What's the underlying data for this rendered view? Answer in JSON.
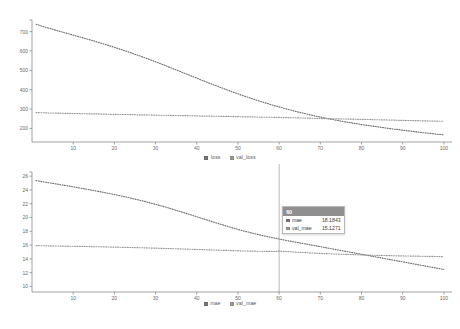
{
  "panels": {
    "loss": {
      "legend": [
        {
          "label": "loss",
          "swatch": "#7a7a7a"
        },
        {
          "label": "val_loss",
          "swatch": "#9a9a9a"
        }
      ]
    },
    "mae": {
      "legend": [
        {
          "label": "mae",
          "swatch": "#7a7a7a"
        },
        {
          "label": "val_mae",
          "swatch": "#9a9a9a"
        }
      ]
    }
  },
  "tooltip": {
    "header": "60",
    "rows": [
      {
        "name": "mae",
        "value": "18.1843",
        "swatch": "#7a7a7a"
      },
      {
        "name": "val_mae",
        "value": "15.1271",
        "swatch": "#9a9a9a"
      }
    ]
  },
  "colors": {
    "axis": "#8c8c8c",
    "series_primary": "#6f6f6f",
    "series_secondary": "#9a9a9a",
    "crosshair": "#9a9a9a",
    "tick_text": "#6a6a6a",
    "background": "#ffffff"
  },
  "chart_data": [
    {
      "type": "line",
      "id": "loss-chart",
      "title": "",
      "xlabel": "",
      "ylabel": "",
      "xlim": [
        0,
        101
      ],
      "ylim": [
        130,
        760
      ],
      "grid": false,
      "legend_position": "bottom-center",
      "xticks": [
        10,
        20,
        30,
        40,
        50,
        60,
        70,
        80,
        90,
        100
      ],
      "yticks": [
        200,
        300,
        400,
        500,
        600,
        700
      ],
      "x": [
        1,
        2,
        3,
        4,
        5,
        6,
        7,
        8,
        9,
        10,
        11,
        12,
        13,
        14,
        15,
        16,
        17,
        18,
        19,
        20,
        21,
        22,
        23,
        24,
        25,
        26,
        27,
        28,
        29,
        30,
        31,
        32,
        33,
        34,
        35,
        36,
        37,
        38,
        39,
        40,
        41,
        42,
        43,
        44,
        45,
        46,
        47,
        48,
        49,
        50,
        51,
        52,
        53,
        54,
        55,
        56,
        57,
        58,
        59,
        60,
        61,
        62,
        63,
        64,
        65,
        66,
        67,
        68,
        69,
        70,
        71,
        72,
        73,
        74,
        75,
        76,
        77,
        78,
        79,
        80,
        81,
        82,
        83,
        84,
        85,
        86,
        87,
        88,
        89,
        90,
        91,
        92,
        93,
        94,
        95,
        96,
        97,
        98,
        99,
        100
      ],
      "series": [
        {
          "name": "loss",
          "values": [
            738,
            731,
            724,
            718,
            712,
            706,
            700,
            694,
            688,
            682,
            676,
            670,
            664,
            658,
            652,
            645,
            639,
            632,
            626,
            619,
            612,
            605,
            598,
            591,
            583,
            576,
            568,
            560,
            552,
            544,
            536,
            528,
            519,
            511,
            502,
            494,
            485,
            477,
            468,
            460,
            451,
            443,
            434,
            426,
            418,
            410,
            402,
            394,
            386,
            379,
            371,
            364,
            357,
            350,
            343,
            336,
            330,
            323,
            317,
            311,
            305,
            299,
            294,
            288,
            283,
            278,
            273,
            268,
            263,
            259,
            254,
            250,
            246,
            242,
            238,
            234,
            231,
            227,
            224,
            220,
            217,
            214,
            211,
            208,
            205,
            202,
            199,
            196,
            194,
            191,
            188,
            186,
            183,
            181,
            178,
            176,
            174,
            171,
            169,
            167
          ]
        },
        {
          "name": "val_loss",
          "values": [
            282,
            281,
            281,
            280,
            280,
            279,
            279,
            278,
            278,
            277,
            277,
            276,
            276,
            275,
            275,
            275,
            274,
            274,
            273,
            273,
            272,
            272,
            272,
            271,
            271,
            270,
            270,
            270,
            269,
            269,
            268,
            268,
            268,
            267,
            267,
            266,
            266,
            266,
            265,
            265,
            264,
            264,
            264,
            263,
            263,
            262,
            262,
            262,
            261,
            261,
            260,
            260,
            260,
            259,
            259,
            258,
            258,
            258,
            257,
            257,
            256,
            256,
            255,
            255,
            254,
            254,
            253,
            253,
            252,
            252,
            251,
            251,
            250,
            250,
            249,
            249,
            248,
            248,
            247,
            247,
            246,
            246,
            245,
            245,
            244,
            244,
            243,
            243,
            242,
            242,
            241,
            241,
            240,
            240,
            239,
            239,
            238,
            238,
            237,
            237
          ]
        }
      ]
    },
    {
      "type": "line",
      "id": "mae-chart",
      "title": "",
      "xlabel": "",
      "ylabel": "",
      "xlim": [
        0,
        101
      ],
      "ylim": [
        9.2,
        26.6
      ],
      "grid": false,
      "legend_position": "bottom-center",
      "xticks": [
        10,
        20,
        30,
        40,
        50,
        60,
        70,
        80,
        90,
        100
      ],
      "yticks": [
        10,
        12,
        14,
        16,
        18,
        20,
        22,
        24,
        26
      ],
      "x": [
        1,
        2,
        3,
        4,
        5,
        6,
        7,
        8,
        9,
        10,
        11,
        12,
        13,
        14,
        15,
        16,
        17,
        18,
        19,
        20,
        21,
        22,
        23,
        24,
        25,
        26,
        27,
        28,
        29,
        30,
        31,
        32,
        33,
        34,
        35,
        36,
        37,
        38,
        39,
        40,
        41,
        42,
        43,
        44,
        45,
        46,
        47,
        48,
        49,
        50,
        51,
        52,
        53,
        54,
        55,
        56,
        57,
        58,
        59,
        60,
        61,
        62,
        63,
        64,
        65,
        66,
        67,
        68,
        69,
        70,
        71,
        72,
        73,
        74,
        75,
        76,
        77,
        78,
        79,
        80,
        81,
        82,
        83,
        84,
        85,
        86,
        87,
        88,
        89,
        90,
        91,
        92,
        93,
        94,
        95,
        96,
        97,
        98,
        99,
        100
      ],
      "series": [
        {
          "name": "mae",
          "values": [
            25.35,
            25.25,
            25.15,
            25.05,
            24.95,
            24.85,
            24.75,
            24.65,
            24.55,
            24.44,
            24.34,
            24.24,
            24.13,
            24.02,
            23.91,
            23.8,
            23.69,
            23.57,
            23.45,
            23.33,
            23.21,
            23.08,
            22.95,
            22.81,
            22.67,
            22.53,
            22.38,
            22.23,
            22.07,
            21.91,
            21.75,
            21.58,
            21.41,
            21.23,
            21.05,
            20.87,
            20.68,
            20.49,
            20.3,
            20.11,
            19.92,
            19.73,
            19.54,
            19.35,
            19.16,
            18.98,
            18.8,
            18.62,
            18.45,
            18.28,
            18.12,
            17.96,
            17.81,
            17.66,
            17.52,
            17.38,
            17.25,
            17.12,
            17.0,
            16.88,
            16.76,
            16.65,
            16.54,
            16.43,
            16.32,
            16.21,
            16.1,
            15.99,
            15.88,
            15.77,
            15.66,
            15.55,
            15.44,
            15.33,
            15.22,
            15.11,
            15.0,
            14.89,
            14.78,
            14.67,
            14.56,
            14.45,
            14.34,
            14.23,
            14.12,
            14.01,
            13.9,
            13.79,
            13.68,
            13.57,
            13.46,
            13.35,
            13.24,
            13.13,
            13.02,
            12.91,
            12.8,
            12.69,
            12.58,
            12.47
          ]
        },
        {
          "name": "val_mae",
          "values": [
            15.92,
            15.91,
            15.9,
            15.89,
            15.88,
            15.87,
            15.86,
            15.85,
            15.84,
            15.83,
            15.82,
            15.81,
            15.8,
            15.79,
            15.77,
            15.76,
            15.75,
            15.74,
            15.72,
            15.71,
            15.7,
            15.68,
            15.67,
            15.65,
            15.64,
            15.62,
            15.61,
            15.59,
            15.57,
            15.56,
            15.54,
            15.52,
            15.5,
            15.48,
            15.47,
            15.45,
            15.43,
            15.41,
            15.39,
            15.37,
            15.35,
            15.33,
            15.31,
            15.29,
            15.27,
            15.25,
            15.23,
            15.21,
            15.19,
            15.17,
            15.15,
            15.14,
            15.13,
            15.12,
            15.11,
            15.1,
            15.09,
            15.08,
            15.07,
            15.13,
            15.1,
            15.06,
            15.02,
            14.98,
            14.95,
            14.92,
            14.89,
            14.86,
            14.83,
            14.8,
            14.77,
            14.75,
            14.72,
            14.7,
            14.68,
            14.66,
            14.64,
            14.62,
            14.6,
            14.58,
            14.56,
            14.54,
            14.53,
            14.51,
            14.5,
            14.48,
            14.47,
            14.45,
            14.44,
            14.43,
            14.42,
            14.41,
            14.4,
            14.39,
            14.38,
            14.37,
            14.36,
            14.35,
            14.34,
            14.33
          ]
        }
      ]
    }
  ]
}
